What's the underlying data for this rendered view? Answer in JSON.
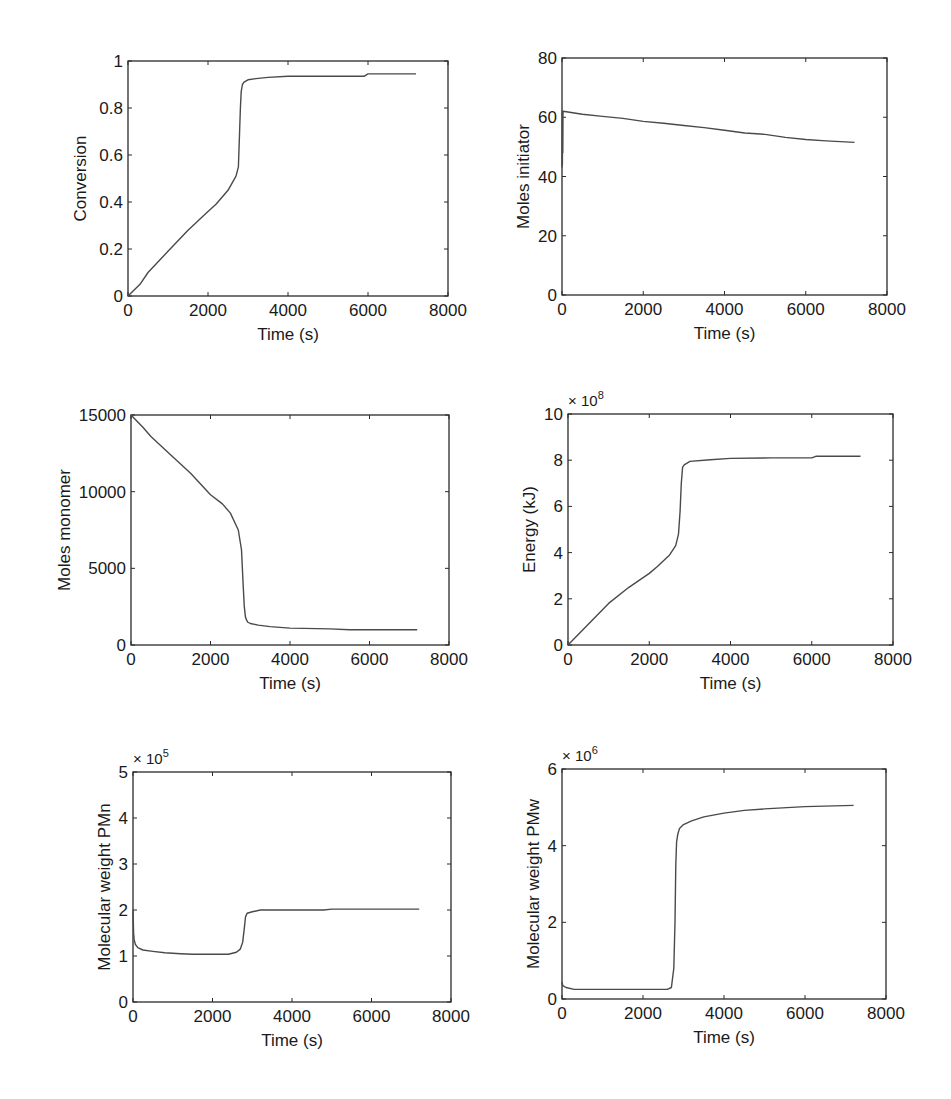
{
  "figure": {
    "panels": 6,
    "layout": "3 rows x 2 columns",
    "line_color": "#4a4a4a",
    "axis_color": "#2a2a2a"
  },
  "chart_data": [
    {
      "type": "line",
      "id": "conversion",
      "title": "",
      "xlabel": "Time (s)",
      "ylabel": "Conversion",
      "xlim": [
        0,
        8000
      ],
      "ylim": [
        0,
        1
      ],
      "xticks": [
        "0",
        "2000",
        "4000",
        "6000",
        "8000"
      ],
      "yticks": [
        "0",
        "0.2",
        "0.4",
        "0.6",
        "0.8",
        "1"
      ],
      "exponent": "",
      "grid": false,
      "box": {
        "x": 128,
        "y": 61,
        "w": 320,
        "h": 235
      },
      "x": [
        0,
        300,
        500,
        1000,
        1500,
        2000,
        2200,
        2500,
        2700,
        2760,
        2790,
        2810,
        2830,
        2860,
        2900,
        3000,
        3200,
        3500,
        4000,
        5000,
        5900,
        6000,
        7200
      ],
      "y": [
        0,
        0.05,
        0.1,
        0.19,
        0.28,
        0.36,
        0.39,
        0.45,
        0.51,
        0.55,
        0.7,
        0.8,
        0.87,
        0.9,
        0.91,
        0.92,
        0.925,
        0.93,
        0.935,
        0.935,
        0.935,
        0.945,
        0.945
      ]
    },
    {
      "type": "line",
      "id": "moles-initiator",
      "title": "",
      "xlabel": "Time (s)",
      "ylabel": "Moles initiator",
      "xlim": [
        0,
        8000
      ],
      "ylim": [
        0,
        80
      ],
      "xticks": [
        "0",
        "2000",
        "4000",
        "6000",
        "8000"
      ],
      "yticks": [
        "0",
        "20",
        "40",
        "60",
        "80"
      ],
      "exponent": "",
      "grid": false,
      "box": {
        "x": 562,
        "y": 58,
        "w": 325,
        "h": 237
      },
      "x": [
        0,
        5,
        10,
        15,
        20,
        25,
        30,
        500,
        1000,
        1500,
        2000,
        2500,
        3000,
        3500,
        4000,
        4500,
        5000,
        5500,
        6000,
        6500,
        7200
      ],
      "y": [
        43,
        62,
        44,
        62,
        48,
        61.5,
        62,
        61,
        60.3,
        59.6,
        58.6,
        58,
        57.2,
        56.5,
        55.6,
        54.7,
        54.2,
        53.2,
        52.5,
        52,
        51.5
      ]
    },
    {
      "type": "line",
      "id": "moles-monomer",
      "title": "",
      "xlabel": "Time (s)",
      "ylabel": "Moles monomer",
      "xlim": [
        0,
        8000
      ],
      "ylim": [
        0,
        15000
      ],
      "xticks": [
        "0",
        "2000",
        "4000",
        "6000",
        "8000"
      ],
      "yticks": [
        "0",
        "5000",
        "10000",
        "15000"
      ],
      "exponent": "",
      "grid": false,
      "box": {
        "x": 131,
        "y": 415,
        "w": 318,
        "h": 230
      },
      "x": [
        0,
        300,
        500,
        1000,
        1500,
        2000,
        2300,
        2500,
        2700,
        2780,
        2820,
        2850,
        2880,
        2930,
        3000,
        3200,
        3500,
        4000,
        5000,
        5500,
        6000,
        7200
      ],
      "y": [
        15000,
        14200,
        13600,
        12400,
        11200,
        9800,
        9200,
        8600,
        7500,
        6200,
        4000,
        2500,
        1800,
        1500,
        1400,
        1300,
        1200,
        1100,
        1050,
        1000,
        1000,
        1000
      ]
    },
    {
      "type": "line",
      "id": "energy",
      "title": "",
      "xlabel": "Time (s)",
      "ylabel": "Energy (kJ)",
      "xlim": [
        0,
        8000
      ],
      "ylim": [
        0,
        10
      ],
      "xticks": [
        "0",
        "2000",
        "4000",
        "6000",
        "8000"
      ],
      "yticks": [
        "0",
        "2",
        "4",
        "6",
        "8",
        "10"
      ],
      "exponent": "× 10^8",
      "exponent_base": "× 10",
      "exponent_power": "8",
      "grid": false,
      "box": {
        "x": 568,
        "y": 414,
        "w": 325,
        "h": 231
      },
      "x": [
        0,
        500,
        1000,
        1500,
        2000,
        2200,
        2500,
        2650,
        2720,
        2760,
        2790,
        2820,
        2860,
        3000,
        3500,
        4000,
        5000,
        6000,
        6100,
        7200
      ],
      "y": [
        0,
        0.9,
        1.8,
        2.5,
        3.1,
        3.4,
        3.9,
        4.3,
        4.8,
        5.8,
        7.0,
        7.7,
        7.8,
        7.95,
        8.02,
        8.08,
        8.1,
        8.1,
        8.17,
        8.17
      ]
    },
    {
      "type": "line",
      "id": "molecular-weight-pmn",
      "title": "",
      "xlabel": "Time (s)",
      "ylabel": "Molecular weight PMn",
      "xlim": [
        0,
        8000
      ],
      "ylim": [
        0,
        5
      ],
      "xticks": [
        "0",
        "2000",
        "4000",
        "6000",
        "8000"
      ],
      "yticks": [
        "0",
        "1",
        "2",
        "3",
        "4",
        "5"
      ],
      "exponent": "× 10^5",
      "exponent_base": "× 10",
      "exponent_power": "5",
      "grid": false,
      "box": {
        "x": 133,
        "y": 772,
        "w": 318,
        "h": 230
      },
      "x": [
        0,
        15,
        30,
        60,
        120,
        250,
        500,
        800,
        1200,
        1500,
        2000,
        2400,
        2600,
        2700,
        2760,
        2800,
        2830,
        2870,
        3000,
        3200,
        4000,
        4800,
        5000,
        6000,
        7200
      ],
      "y": [
        2.0,
        1.5,
        1.35,
        1.25,
        1.18,
        1.13,
        1.1,
        1.07,
        1.05,
        1.04,
        1.04,
        1.04,
        1.08,
        1.15,
        1.3,
        1.6,
        1.85,
        1.93,
        1.96,
        2.0,
        2.0,
        2.0,
        2.02,
        2.02,
        2.02
      ]
    },
    {
      "type": "line",
      "id": "molecular-weight-pmw",
      "title": "",
      "xlabel": "Time (s)",
      "ylabel": "Molecular weight PMw",
      "xlim": [
        0,
        8000
      ],
      "ylim": [
        0,
        6
      ],
      "xticks": [
        "0",
        "2000",
        "4000",
        "6000",
        "8000"
      ],
      "yticks": [
        "0",
        "2",
        "4",
        "6"
      ],
      "exponent": "× 10^6",
      "exponent_base": "× 10",
      "exponent_power": "6",
      "grid": false,
      "box": {
        "x": 562,
        "y": 769,
        "w": 324,
        "h": 230
      },
      "x": [
        0,
        20,
        100,
        300,
        1000,
        2000,
        2600,
        2700,
        2760,
        2790,
        2810,
        2830,
        2860,
        2900,
        3000,
        3200,
        3500,
        4000,
        4500,
        5000,
        6000,
        7200
      ],
      "y": [
        0.45,
        0.35,
        0.3,
        0.25,
        0.25,
        0.25,
        0.25,
        0.3,
        0.8,
        2.0,
        3.5,
        4.1,
        4.3,
        4.45,
        4.55,
        4.65,
        4.75,
        4.85,
        4.92,
        4.96,
        5.02,
        5.05
      ]
    }
  ]
}
